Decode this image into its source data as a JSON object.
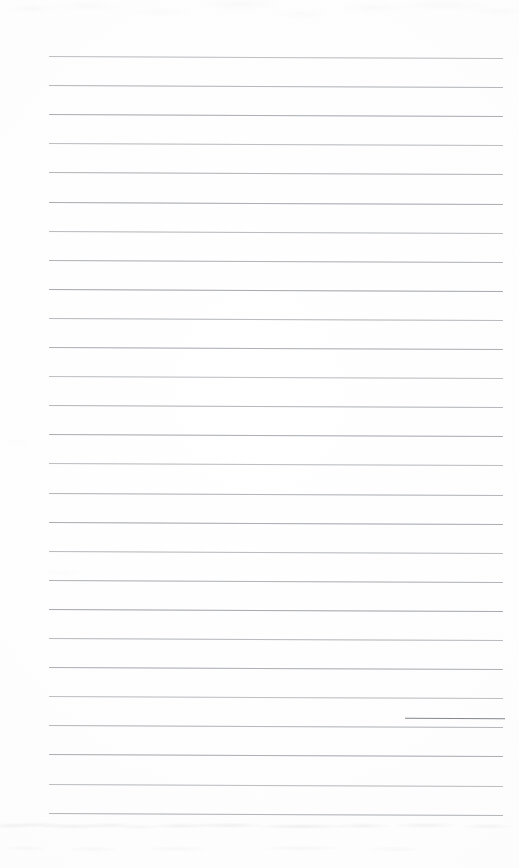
{
  "document": {
    "kind": "scanned-lined-paper",
    "title": "Blank ruled notebook page (scan)",
    "page_width": 519,
    "page_height": 868,
    "background_color": "#fefefe",
    "rule_color": "#b4b7bb",
    "dark_segment_color": "#6e7378",
    "text_content": ""
  },
  "ruling": {
    "line_count": 27,
    "first_line_y": 56,
    "line_spacing": 29.1,
    "line_left_x": 49,
    "line_right_x": 503,
    "line_thickness": 1,
    "skew_px_over_width": 2,
    "left_margin_px": 49,
    "right_margin_px": 16,
    "top_margin_px": 56,
    "bottom_margin_px": 56
  },
  "artifacts": {
    "dark_segment": {
      "on_line_index": 23,
      "y": 718,
      "x_start": 405,
      "x_end": 505
    },
    "top_noise_band_height": 14,
    "bottom_smudge_band_height": 52
  }
}
